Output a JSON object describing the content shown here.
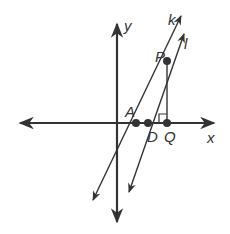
{
  "diagram": {
    "axes": {
      "x_label": "x",
      "y_label": "y"
    },
    "points": {
      "A": "A",
      "D": "D",
      "Q": "Q",
      "P": "P"
    },
    "lines": {
      "k": "k",
      "l": "l"
    },
    "colors": {
      "stroke": "#333333",
      "background": "#ffffff"
    }
  }
}
